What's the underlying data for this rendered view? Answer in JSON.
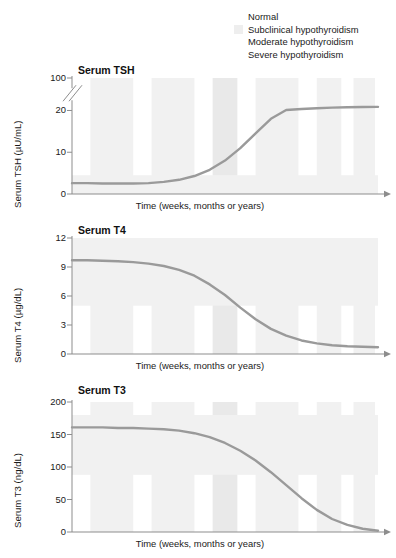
{
  "legend": {
    "items": [
      {
        "label": "Normal",
        "color": "#ffffff"
      },
      {
        "label": "Subclinical hypothyroidism",
        "color": "#eeeeee"
      },
      {
        "label": "Moderate hypothyroidism",
        "color": "#ffffff"
      },
      {
        "label": "Severe hypothyroidism",
        "color": "#ffffff"
      }
    ]
  },
  "colors": {
    "curve": "#9a9a9a",
    "axis": "#8d8d8d",
    "band": "#f1f1f1",
    "band_strong": "#e9e9e9",
    "text": "#1a1a1a"
  },
  "xlabel": "Time (weeks, months or years)",
  "chart_data": [
    {
      "type": "line",
      "title": "Serum TSH",
      "ylabel": "Serum TSH (µU/mL)",
      "xlabel": "Time (weeks, months or years)",
      "ytick_labels": [
        "0",
        "10",
        "20",
        "100"
      ],
      "ytick_values": [
        0,
        10,
        20,
        100
      ],
      "axis_break": true,
      "axis_break_between": [
        20,
        100
      ],
      "ylim": [
        0,
        100
      ],
      "grid": false,
      "legend_position": "top-right",
      "x": [
        0,
        5,
        10,
        15,
        20,
        25,
        30,
        35,
        40,
        45,
        50,
        55,
        60,
        65,
        70,
        75,
        80,
        85,
        90,
        95,
        100
      ],
      "values": [
        2.6,
        2.6,
        2.5,
        2.5,
        2.5,
        2.6,
        2.9,
        3.4,
        4.3,
        5.8,
        8.0,
        11.0,
        14.5,
        18.0,
        21.0,
        23.5,
        25.5,
        27.0,
        28.0,
        28.6,
        29.0
      ]
    },
    {
      "type": "line",
      "title": "Serum T4",
      "ylabel": "Serum T4 (µg/dL)",
      "xlabel": "Time (weeks, months or years)",
      "ytick_labels": [
        "0",
        "3",
        "6",
        "9",
        "12"
      ],
      "ytick_values": [
        0,
        3,
        6,
        9,
        12
      ],
      "ylim": [
        0,
        12
      ],
      "grid": false,
      "x": [
        0,
        5,
        10,
        15,
        20,
        25,
        30,
        35,
        40,
        45,
        50,
        55,
        60,
        65,
        70,
        75,
        80,
        85,
        90,
        95,
        100
      ],
      "values": [
        9.7,
        9.7,
        9.65,
        9.6,
        9.5,
        9.35,
        9.1,
        8.7,
        8.1,
        7.2,
        6.1,
        4.8,
        3.6,
        2.6,
        1.9,
        1.4,
        1.1,
        0.9,
        0.8,
        0.75,
        0.7
      ]
    },
    {
      "type": "line",
      "title": "Serum T3",
      "ylabel": "Serum T3 (ng/dL)",
      "xlabel": "Time (weeks, months or years)",
      "ytick_labels": [
        "0",
        "50",
        "100",
        "150",
        "200"
      ],
      "ytick_values": [
        0,
        50,
        100,
        150,
        200
      ],
      "ylim": [
        0,
        200
      ],
      "grid": false,
      "x": [
        0,
        5,
        10,
        15,
        20,
        25,
        30,
        35,
        40,
        45,
        50,
        55,
        60,
        65,
        70,
        75,
        80,
        85,
        90,
        95,
        100
      ],
      "values": [
        161,
        161,
        161,
        160,
        160,
        159,
        158,
        156,
        152,
        146,
        137,
        125,
        110,
        92,
        72,
        52,
        34,
        20,
        11,
        5,
        2
      ]
    }
  ],
  "bands": [
    {
      "x0": 6,
      "x1": 20
    },
    {
      "x0": 26,
      "x1": 40
    },
    {
      "x0": 46,
      "x1": 54
    },
    {
      "x0": 60,
      "x1": 74
    },
    {
      "x0": 80,
      "x1": 88
    },
    {
      "x0": 92,
      "x1": 99
    }
  ]
}
